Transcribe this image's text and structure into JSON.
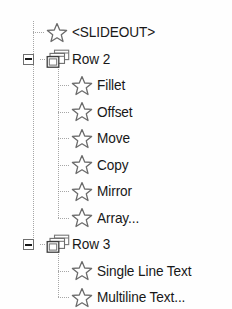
{
  "tree": {
    "name": "object-tree",
    "background_color": "#fefefe",
    "text_color": "#181818",
    "line_color": "#8d8d8d",
    "row_height": 26.5,
    "first_row_top": 22,
    "icons": {
      "leaf": "star-icon",
      "group": "folder-window-icon",
      "collapse": "minus-box-icon"
    },
    "rows": [
      {
        "label": "<SLIDEOUT>",
        "icon": "star-icon",
        "level": 1,
        "has_toggle": false,
        "expanded": null
      },
      {
        "label": "Row 2",
        "icon": "folder-window-icon",
        "level": 0,
        "has_toggle": true,
        "expanded": true
      },
      {
        "label": "Fillet",
        "icon": "star-icon",
        "level": 2,
        "has_toggle": false,
        "expanded": null
      },
      {
        "label": "Offset",
        "icon": "star-icon",
        "level": 2,
        "has_toggle": false,
        "expanded": null
      },
      {
        "label": "Move",
        "icon": "star-icon",
        "level": 2,
        "has_toggle": false,
        "expanded": null
      },
      {
        "label": "Copy",
        "icon": "star-icon",
        "level": 2,
        "has_toggle": false,
        "expanded": null
      },
      {
        "label": "Mirror",
        "icon": "star-icon",
        "level": 2,
        "has_toggle": false,
        "expanded": null
      },
      {
        "label": "Array...",
        "icon": "star-icon",
        "level": 2,
        "has_toggle": false,
        "expanded": null
      },
      {
        "label": "Row 3",
        "icon": "folder-window-icon",
        "level": 0,
        "has_toggle": true,
        "expanded": true
      },
      {
        "label": "Single Line Text",
        "icon": "star-icon",
        "level": 2,
        "has_toggle": false,
        "expanded": null
      },
      {
        "label": "Multiline Text...",
        "icon": "star-icon",
        "level": 2,
        "has_toggle": false,
        "expanded": null
      }
    ]
  }
}
